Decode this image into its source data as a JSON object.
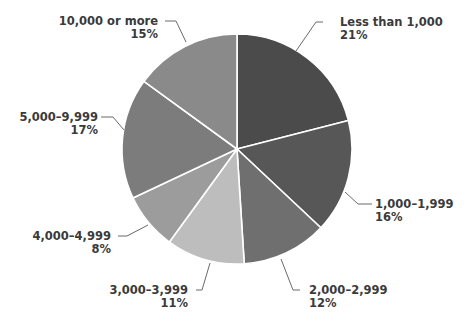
{
  "chart_data": {
    "type": "pie",
    "title": "",
    "start_angle_deg": 0,
    "direction": "clockwise",
    "slices": [
      {
        "label": "Less than 1,000",
        "value": 21,
        "pct_label": "21%",
        "color": "#4b4b4b"
      },
      {
        "label": "1,000–1,999",
        "value": 16,
        "pct_label": "16%",
        "color": "#575757"
      },
      {
        "label": "2,000–2,999",
        "value": 12,
        "pct_label": "12%",
        "color": "#6f6f6f"
      },
      {
        "label": "3,000–3,999",
        "value": 11,
        "pct_label": "11%",
        "color": "#bdbdbd"
      },
      {
        "label": "4,000–4,999",
        "value": 8,
        "pct_label": "8%",
        "color": "#9c9c9c"
      },
      {
        "label": "5,000–9,999",
        "value": 17,
        "pct_label": "17%",
        "color": "#7c7c7c"
      },
      {
        "label": "10,000 or more",
        "value": 15,
        "pct_label": "15%",
        "color": "#8a8a8a"
      }
    ],
    "categories": [
      "Less than 1,000",
      "1,000–1,999",
      "2,000–2,999",
      "3,000–3,999",
      "4,000–4,999",
      "5,000–9,999",
      "10,000 or more"
    ],
    "values": [
      21,
      16,
      12,
      11,
      8,
      17,
      15
    ],
    "legend": "none (direct labels with leader lines)"
  },
  "labels": [
    {
      "name": "Less than 1,000",
      "pct": "21%"
    },
    {
      "name": "1,000–1,999",
      "pct": "16%"
    },
    {
      "name": "2,000–2,999",
      "pct": "12%"
    },
    {
      "name": "3,000–3,999",
      "pct": "11%"
    },
    {
      "name": "4,000–4,999",
      "pct": "8%"
    },
    {
      "name": "5,000–9,999",
      "pct": "17%"
    },
    {
      "name": "10,000 or more",
      "pct": "15%"
    }
  ]
}
